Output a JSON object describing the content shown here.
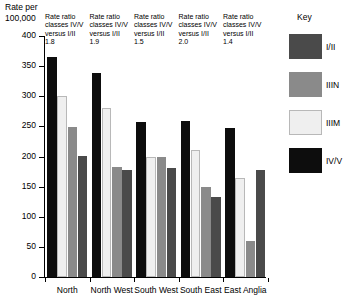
{
  "chart_data": {
    "type": "bar",
    "title": "",
    "ylabel": "Rate per 100,000",
    "xlabel": "",
    "ylim": [
      0,
      400
    ],
    "yticks": [
      0,
      50,
      100,
      150,
      200,
      250,
      300,
      350,
      400
    ],
    "ytick_labels": [
      "0",
      "50",
      "100",
      "150",
      "200",
      "250",
      "300",
      "350",
      "400"
    ],
    "grid": false,
    "legend_position": "right",
    "legend_title": "Key",
    "categories": [
      "North",
      "North West",
      "South West",
      "South East",
      "East Anglia"
    ],
    "series": [
      {
        "name": "IV/V",
        "color": "#0d0d0d",
        "values": [
          365,
          338,
          257,
          259,
          248
        ]
      },
      {
        "name": "IIIM",
        "color": "#efefef",
        "values": [
          300,
          280,
          199,
          211,
          165
        ]
      },
      {
        "name": "IIIN",
        "color": "#8a8a8a",
        "values": [
          249,
          182,
          199,
          149,
          60
        ]
      },
      {
        "name": "I/II",
        "color": "#4a4a4a",
        "values": [
          201,
          178,
          181,
          133,
          178
        ]
      }
    ],
    "annotations": [
      {
        "category": "North",
        "text": "Rate ratio\nclasses IV/V\nversus I/II",
        "value": "1.8"
      },
      {
        "category": "North West",
        "text": "Rate ratio\nclasses IV/V\nversus I/II",
        "value": "1.9"
      },
      {
        "category": "South West",
        "text": "Rate ratio\nclasses IV/V\nversus I/II",
        "value": "1.5"
      },
      {
        "category": "South East",
        "text": "Rate ratio\nclasses IV/V\nversus I/II",
        "value": "2.0"
      },
      {
        "category": "East Anglia",
        "text": "Rate ratio\nclasses IV/V\nversus I/II",
        "value": "1.4"
      }
    ]
  },
  "axis": {
    "ylabel_line1": "Rate per",
    "ylabel_line2": "100,000"
  },
  "legend": {
    "title": "Key",
    "entries": [
      {
        "label": "I/II",
        "color": "#4a4a4a"
      },
      {
        "label": "IIIN",
        "color": "#8a8a8a"
      },
      {
        "label": "IIIM",
        "color": "#efefef"
      },
      {
        "label": "IV/V",
        "color": "#0d0d0d"
      }
    ]
  }
}
